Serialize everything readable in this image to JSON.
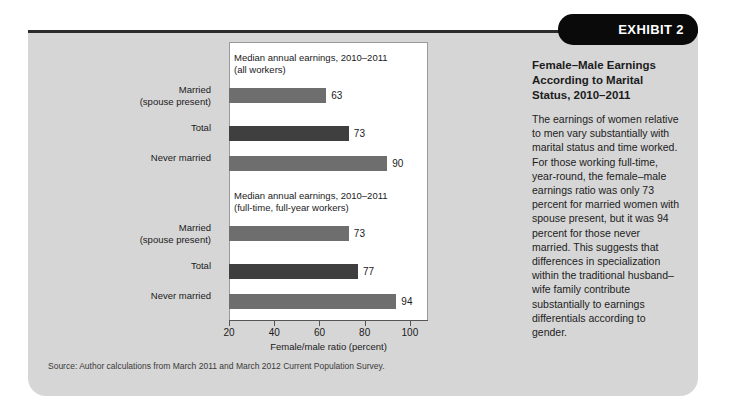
{
  "exhibit": {
    "badge_label": "EXHIBIT 2",
    "heading": "Female–Male Earnings\nAccording to Marital\nStatus, 2010–2011",
    "body": "The earnings of women relative to men vary substantially with marital status and time worked. For those working full-time, year-round, the female–male earnings ratio was only 73 percent for married women with spouse present, but it was 94 percent for those never married. This suggests that differences in specialization within the traditional husband–wife family contribute substantially to earnings differentials according to gender."
  },
  "source_note": "Source: Author calculations from March 2011 and March 2012 Current Population Survey.",
  "chart_data": {
    "type": "bar",
    "orientation": "horizontal",
    "title": "",
    "xlabel": "Female/male ratio (percent)",
    "ylabel": "",
    "xlim": [
      20,
      108
    ],
    "xticks": [
      20,
      40,
      60,
      80,
      100
    ],
    "grid": false,
    "legend": "none",
    "panels": [
      {
        "title": "Median annual earnings, 2010–2011\n(all workers)",
        "categories": [
          "Married\n(spouse present)",
          "Total",
          "Never married"
        ],
        "values": [
          63,
          73,
          90
        ],
        "value_labels": [
          "63",
          "73",
          "90"
        ],
        "colors": [
          "#6e6e6e",
          "#3f3f3f",
          "#6e6e6e"
        ]
      },
      {
        "title": "Median annual earnings, 2010–2011\n(full-time, full-year workers)",
        "categories": [
          "Married\n(spouse present)",
          "Total",
          "Never married"
        ],
        "values": [
          73,
          77,
          94
        ],
        "value_labels": [
          "73",
          "77",
          "94"
        ],
        "colors": [
          "#6e6e6e",
          "#3f3f3f",
          "#6e6e6e"
        ]
      }
    ]
  },
  "colors": {
    "card_background": "#d6d6d6",
    "badge_background": "#0a0a0a",
    "plot_background": "#ffffff",
    "bar_light": "#6e6e6e",
    "bar_dark": "#3f3f3f"
  }
}
